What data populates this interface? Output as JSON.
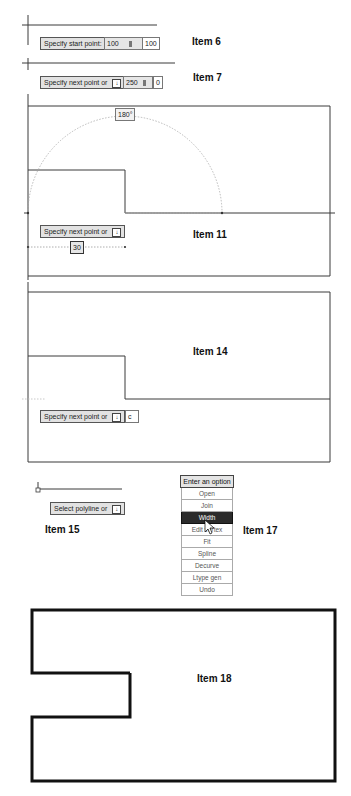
{
  "item6": {
    "label": "Item 6",
    "prompt": "Specify start point:",
    "x_value": "100",
    "y_value": "100"
  },
  "item7": {
    "label": "Item 7",
    "prompt": "Specify next point or",
    "length_value": "250",
    "angle_value": "0"
  },
  "item11": {
    "label": "Item 11",
    "angle_tooltip": "180°",
    "prompt": "Specify next point or",
    "dimension_value": "30"
  },
  "item14": {
    "label": "Item 14",
    "prompt": "Specify next point or",
    "input_value": "c"
  },
  "item15": {
    "label": "Item 15",
    "prompt": "Select polyline or"
  },
  "item17": {
    "label": "Item 17",
    "menu_header": "Enter an option",
    "options": [
      "Open",
      "Join",
      "Width",
      "Edit vertex",
      "Fit",
      "Spline",
      "Decurve",
      "Ltype gen",
      "Undo"
    ],
    "selected_index": 2
  },
  "item18": {
    "label": "Item 18"
  },
  "colors": {
    "line": "#3a3a3a",
    "prompt_bg": "#e2e2e2",
    "menu_selected_bg": "#2b2b2b"
  }
}
